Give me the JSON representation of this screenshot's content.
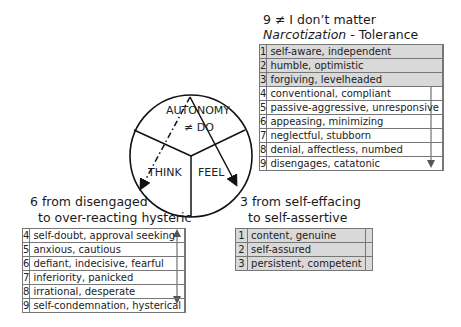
{
  "diagram": {
    "center_labels": {
      "autonomy": "AUTONOMY",
      "not_do": "≠ DO",
      "think": "THINK",
      "feel": "FEEL"
    },
    "top_section": {
      "title_line1": "9  ≠ I don’t matter",
      "title_italic": "Narcotization",
      "title_rest": " - Tolerance",
      "rows": [
        {
          "num": "1",
          "text": "self-aware, independent",
          "shaded": true
        },
        {
          "num": "2",
          "text": "humble, optimistic",
          "shaded": true
        },
        {
          "num": "3",
          "text": "forgiving, levelheaded",
          "shaded": true
        },
        {
          "num": "4",
          "text": "conventional, compliant",
          "shaded": false
        },
        {
          "num": "5",
          "text": "passive-aggressive, unresponsive",
          "shaded": false
        },
        {
          "num": "6",
          "text": "appeasing, minimizing",
          "shaded": false
        },
        {
          "num": "7",
          "text": "neglectful, stubborn",
          "shaded": false
        },
        {
          "num": "8",
          "text": "denial, affectless, numbed",
          "shaded": false
        },
        {
          "num": "9",
          "text": "disengages, catatonic",
          "shaded": false
        }
      ]
    },
    "left_section": {
      "title_line1": "6 from disengaged",
      "title_line2": "to over-reacting hysteric",
      "rows": [
        {
          "num": "4",
          "text": "self-doubt, approval seeking"
        },
        {
          "num": "5",
          "text": "anxious, cautious"
        },
        {
          "num": "6",
          "text": "defiant, indecisive, fearful"
        },
        {
          "num": "7",
          "text": "inferiority, panicked"
        },
        {
          "num": "8",
          "text": "irrational, desperate"
        },
        {
          "num": "9",
          "text": "self-condemnation, hysterical"
        }
      ]
    },
    "right_section": {
      "title_line1": "3 from self-effacing",
      "title_line2": "to self-assertive",
      "rows": [
        {
          "num": "1",
          "text": "content, genuine"
        },
        {
          "num": "2",
          "text": "self-assured"
        },
        {
          "num": "3",
          "text": "persistent, competent"
        }
      ]
    },
    "colors": {
      "shade": "#d9d9d9",
      "line": "#222222",
      "border": "#777777"
    }
  }
}
